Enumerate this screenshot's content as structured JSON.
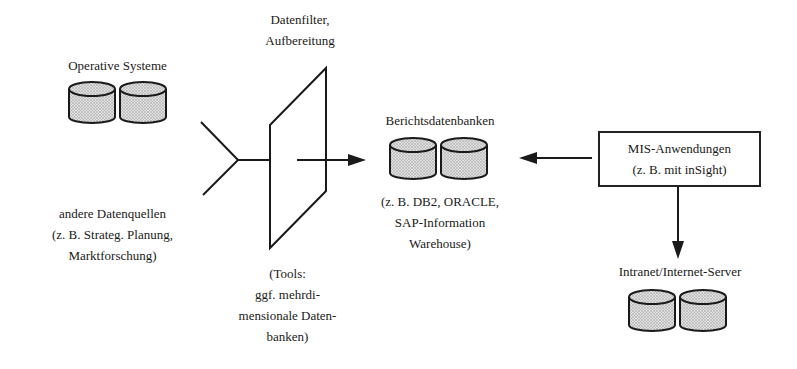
{
  "diagram": {
    "nodes": {
      "operative_systeme": {
        "label": "Operative Systeme"
      },
      "andere_datenquellen": {
        "lines": [
          "andere Datenquellen",
          "(z. B. Strateg. Planung,",
          "Marktforschung)"
        ]
      },
      "datenfilter": {
        "lines": [
          "Datenfilter,",
          "Aufbereitung"
        ]
      },
      "tools": {
        "lines": [
          "(Tools:",
          "ggf. mehrdi-",
          "mensionale Daten-",
          "banken)"
        ]
      },
      "berichtsdatenbanken": {
        "label": "Berichtsdatenbanken",
        "lines": [
          "(z. B. DB2, ORACLE,",
          "SAP-Information",
          "Warehouse)"
        ]
      },
      "mis_anwendungen": {
        "lines": [
          "MIS-Anwendungen",
          "(z. B. mit inSight)"
        ]
      },
      "intranet_server": {
        "label": "Intranet/Internet-Server"
      }
    },
    "edges": [
      {
        "from": "operative_systeme",
        "to": "datenfilter",
        "style": "line"
      },
      {
        "from": "andere_datenquellen",
        "to": "datenfilter",
        "style": "line"
      },
      {
        "from": "datenfilter",
        "to": "berichtsdatenbanken",
        "style": "arrow"
      },
      {
        "from": "mis_anwendungen",
        "to": "berichtsdatenbanken",
        "style": "arrow"
      },
      {
        "from": "mis_anwendungen",
        "to": "intranet_server",
        "style": "arrow"
      }
    ],
    "colors": {
      "stroke": "#1a1a1a",
      "cylinder_fill": "#cfcfcf",
      "background": "#ffffff"
    }
  }
}
